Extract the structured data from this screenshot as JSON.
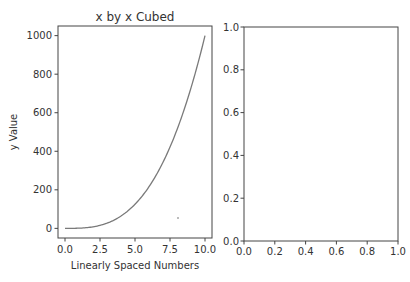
{
  "figure": {
    "colors": {
      "line": "#7a7a7a",
      "axis": "#444444",
      "text": "#333333"
    }
  },
  "chart_data": [
    {
      "type": "line",
      "title": "x by x Cubed",
      "xlabel": "Linearly Spaced Numbers",
      "ylabel": "y Value",
      "xlim": [
        -0.5,
        10.5
      ],
      "ylim": [
        -50,
        1050
      ],
      "xticks": [
        "0.0",
        "2.5",
        "5.0",
        "7.5",
        "10.0"
      ],
      "yticks": [
        "0",
        "200",
        "400",
        "600",
        "800",
        "1000"
      ],
      "grid": false,
      "series": [
        {
          "name": "y = x^3",
          "x": [
            0,
            1,
            2,
            3,
            4,
            5,
            6,
            7,
            8,
            9,
            10
          ],
          "values": [
            0,
            1,
            8,
            27,
            64,
            125,
            216,
            343,
            512,
            729,
            1000
          ]
        }
      ]
    },
    {
      "type": "line",
      "title": "",
      "xlabel": "",
      "ylabel": "",
      "xlim": [
        0,
        1
      ],
      "ylim": [
        0,
        1
      ],
      "xticks": [
        "0.0",
        "0.2",
        "0.4",
        "0.6",
        "0.8",
        "1.0"
      ],
      "yticks": [
        "0.0",
        "0.2",
        "0.4",
        "0.6",
        "0.8",
        "1.0"
      ],
      "grid": false,
      "series": []
    }
  ]
}
